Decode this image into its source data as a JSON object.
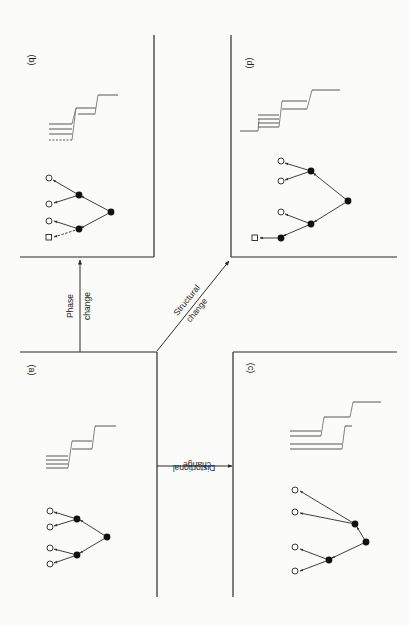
{
  "figure": {
    "colors": {
      "ink": "#2a2a2a",
      "stroke_light": "#555555",
      "background": "#fbfbfa"
    },
    "panels": [
      {
        "id": "a",
        "label": "(a)",
        "position": "bottom-left"
      },
      {
        "id": "b",
        "label": "(b)",
        "position": "top-left"
      },
      {
        "id": "c",
        "label": "(c)",
        "position": "bottom-right"
      },
      {
        "id": "d",
        "label": "(d)",
        "position": "top-right"
      }
    ],
    "transitions": [
      {
        "from": "a",
        "to": "b",
        "label_line1": "Phase",
        "label_line2": "change"
      },
      {
        "from": "a",
        "to": "d",
        "label_line1": "Structural",
        "label_line2": "change"
      },
      {
        "from": "a",
        "to": "c",
        "label_line1": "Distortional",
        "label_line2": "change"
      }
    ],
    "legend_nodes": {
      "filled_circle": "intermediate node",
      "open_circle": "terminal node",
      "open_square": "new terminal node"
    }
  },
  "labels": {
    "a": "(a)",
    "b": "(b)",
    "c": "(c)",
    "d": "(d)",
    "phase_1": "Phase",
    "phase_2": "change",
    "structural_1": "Structural",
    "structural_2": "change",
    "distortional_1": "Distortional",
    "distortional_2": "change"
  }
}
